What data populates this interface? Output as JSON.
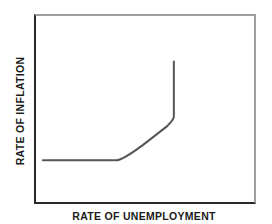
{
  "chart_data": {
    "type": "line",
    "title": "",
    "xlabel": "RATE OF UNEMPLOYMENT",
    "ylabel": "RATE OF INFLATION",
    "xlim": [
      0,
      100
    ],
    "ylim": [
      0,
      100
    ],
    "grid": false,
    "legend": null,
    "axis_ticks": "none",
    "series": [
      {
        "name": "curve",
        "color": "#555555",
        "x": [
          4,
          37,
          49,
          60,
          63,
          63
        ],
        "y": [
          23,
          23,
          31,
          41,
          46,
          75
        ]
      }
    ]
  },
  "labels": {
    "x_axis": "RATE OF UNEMPLOYMENT",
    "y_axis": "RATE OF INFLATION"
  },
  "colors": {
    "axis_dark": "#2a2a2a",
    "frame_light": "#a0a0a0",
    "curve": "#555555",
    "label": "#1a1a1a"
  }
}
